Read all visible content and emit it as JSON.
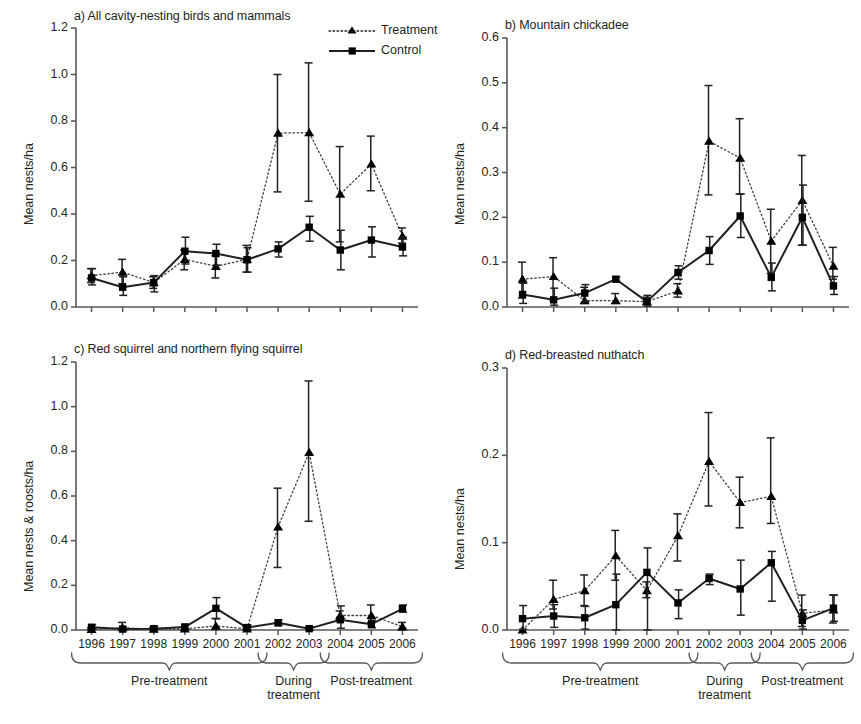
{
  "figure": {
    "legend": {
      "treatment_label": "Treatment",
      "control_label": "Control",
      "treatment_marker": "triangle-marker",
      "treatment_line": "dotted-line",
      "control_marker": "square-marker",
      "control_line": "solid-line"
    },
    "axis_groups": [
      {
        "label": "Pre-treatment",
        "years": [
          "1996",
          "1997",
          "1998",
          "1999",
          "2000",
          "2001"
        ]
      },
      {
        "label": "During\ntreatment",
        "label_line1": "During",
        "label_line2": "treatment",
        "years": [
          "2002",
          "2003"
        ]
      },
      {
        "label": "Post-treatment",
        "years": [
          "2004",
          "2005",
          "2006"
        ]
      }
    ],
    "years": [
      "1996",
      "1997",
      "1998",
      "1999",
      "2000",
      "2001",
      "2002",
      "2003",
      "2004",
      "2005",
      "2006"
    ],
    "colors": {
      "ink": "#231f20",
      "axis": "#58595b",
      "marker": "#000000"
    }
  },
  "chart_data": [
    {
      "panel": "a",
      "type": "line",
      "title": "a) All cavity-nesting birds and mammals",
      "xlabel": "",
      "ylabel": "Mean nests/ha",
      "ylim": [
        0.0,
        1.2
      ],
      "yticks": [
        0.0,
        0.2,
        0.4,
        0.6,
        0.8,
        1.0,
        1.2
      ],
      "ytick_labels": [
        "0.0",
        "0.2",
        "0.4",
        "0.6",
        "0.8",
        "1.0",
        "1.2"
      ],
      "grid": false,
      "legend_position": "top-right",
      "categories": [
        "1996",
        "1997",
        "1998",
        "1999",
        "2000",
        "2001",
        "2002",
        "2003",
        "2004",
        "2005",
        "2006"
      ],
      "series": [
        {
          "name": "Treatment",
          "values": [
            0.135,
            0.15,
            0.105,
            0.205,
            0.175,
            0.205,
            0.748,
            0.75,
            0.485,
            0.615,
            0.305
          ],
          "err_low": [
            0.105,
            0.1,
            0.08,
            0.16,
            0.125,
            0.15,
            0.495,
            0.455,
            0.28,
            0.5,
            0.275
          ],
          "err_high": [
            0.165,
            0.205,
            0.13,
            0.245,
            0.22,
            0.265,
            1.0,
            1.05,
            0.69,
            0.735,
            0.34
          ]
        },
        {
          "name": "Control",
          "values": [
            0.125,
            0.085,
            0.105,
            0.24,
            0.23,
            0.203,
            0.25,
            0.343,
            0.245,
            0.288,
            0.258
          ],
          "err_low": [
            0.095,
            0.05,
            0.065,
            0.185,
            0.18,
            0.15,
            0.215,
            0.283,
            0.16,
            0.215,
            0.22
          ],
          "err_high": [
            0.165,
            0.13,
            0.135,
            0.3,
            0.27,
            0.255,
            0.28,
            0.39,
            0.33,
            0.345,
            0.3
          ]
        }
      ]
    },
    {
      "panel": "b",
      "type": "line",
      "title": "b) Mountain chickadee",
      "xlabel": "",
      "ylabel": "Mean nests/ha",
      "ylim": [
        0.0,
        0.6
      ],
      "yticks": [
        0.0,
        0.1,
        0.2,
        0.3,
        0.4,
        0.5,
        0.6
      ],
      "ytick_labels": [
        "0.0",
        "0.1",
        "0.2",
        "0.3",
        "0.4",
        "0.5",
        "0.6"
      ],
      "grid": false,
      "legend_position": "none",
      "categories": [
        "1996",
        "1997",
        "1998",
        "1999",
        "2000",
        "2001",
        "2002",
        "2003",
        "2004",
        "2005",
        "2006"
      ],
      "series": [
        {
          "name": "Treatment",
          "values": [
            0.062,
            0.068,
            0.014,
            0.014,
            0.012,
            0.036,
            0.37,
            0.332,
            0.147,
            0.238,
            0.091
          ],
          "err_low": [
            0.02,
            0.016,
            0.008,
            0.008,
            0.006,
            0.022,
            0.25,
            0.252,
            0.075,
            0.138,
            0.062
          ],
          "err_high": [
            0.1,
            0.11,
            0.044,
            0.03,
            0.022,
            0.052,
            0.494,
            0.42,
            0.218,
            0.338,
            0.133
          ]
        },
        {
          "name": "Control",
          "values": [
            0.028,
            0.016,
            0.031,
            0.062,
            0.012,
            0.077,
            0.126,
            0.203,
            0.066,
            0.2,
            0.047
          ],
          "err_low": [
            0.008,
            0.004,
            0.012,
            0.057,
            0.002,
            0.062,
            0.095,
            0.155,
            0.036,
            0.138,
            0.028
          ],
          "err_high": [
            0.053,
            0.042,
            0.05,
            0.067,
            0.026,
            0.092,
            0.157,
            0.252,
            0.098,
            0.272,
            0.068
          ]
        }
      ]
    },
    {
      "panel": "c",
      "type": "line",
      "title": "c) Red squirrel and northern flying squirrel",
      "xlabel": "",
      "ylabel": "Mean nests & roosts/ha",
      "ylim": [
        0.0,
        1.2
      ],
      "yticks": [
        0.0,
        0.2,
        0.4,
        0.6,
        0.8,
        1.0,
        1.2
      ],
      "ytick_labels": [
        "0.0",
        "0.2",
        "0.4",
        "0.6",
        "0.8",
        "1.0",
        "1.2"
      ],
      "grid": false,
      "legend_position": "none",
      "categories": [
        "1996",
        "1997",
        "1998",
        "1999",
        "2000",
        "2001",
        "2002",
        "2003",
        "2004",
        "2005",
        "2006"
      ],
      "series": [
        {
          "name": "Treatment",
          "values": [
            0.003,
            0.01,
            0.004,
            0.005,
            0.018,
            0.005,
            0.462,
            0.795,
            0.065,
            0.065,
            0.015
          ],
          "err_low": [
            0.0,
            0.0,
            0.0,
            0.0,
            0.002,
            0.0,
            0.28,
            0.487,
            0.048,
            0.03,
            0.0
          ],
          "err_high": [
            0.01,
            0.034,
            0.012,
            0.014,
            0.052,
            0.014,
            0.635,
            1.115,
            0.085,
            0.112,
            0.034
          ]
        },
        {
          "name": "Control",
          "values": [
            0.012,
            0.004,
            0.006,
            0.013,
            0.097,
            0.011,
            0.032,
            0.006,
            0.046,
            0.026,
            0.095
          ],
          "err_low": [
            0.004,
            0.0,
            0.0,
            0.004,
            0.05,
            0.002,
            0.02,
            0.0,
            0.008,
            0.01,
            0.08
          ],
          "err_high": [
            0.024,
            0.012,
            0.016,
            0.026,
            0.145,
            0.022,
            0.046,
            0.014,
            0.108,
            0.044,
            0.112
          ]
        }
      ]
    },
    {
      "panel": "d",
      "type": "line",
      "title": "d) Red-breasted nuthatch",
      "xlabel": "",
      "ylabel": "Mean nests/ha",
      "ylim": [
        0.0,
        0.3
      ],
      "yticks": [
        0.0,
        0.1,
        0.2,
        0.3
      ],
      "ytick_labels": [
        "0.0",
        "0.1",
        "0.2",
        "0.3"
      ],
      "grid": false,
      "legend_position": "none",
      "categories": [
        "1996",
        "1997",
        "1998",
        "1999",
        "2000",
        "2001",
        "2002",
        "2003",
        "2004",
        "2005",
        "2006"
      ],
      "series": [
        {
          "name": "Treatment",
          "values": [
            0.0,
            0.035,
            0.045,
            0.085,
            0.045,
            0.108,
            0.193,
            0.146,
            0.153,
            0.019,
            0.023
          ],
          "err_low": [
            0.0,
            0.024,
            0.028,
            0.057,
            0.037,
            0.079,
            0.142,
            0.117,
            0.122,
            0.004,
            0.008
          ],
          "err_high": [
            0.0,
            0.057,
            0.063,
            0.114,
            0.055,
            0.133,
            0.249,
            0.175,
            0.22,
            0.04,
            0.04
          ]
        },
        {
          "name": "Control",
          "values": [
            0.013,
            0.016,
            0.014,
            0.029,
            0.066,
            0.031,
            0.059,
            0.047,
            0.077,
            0.011,
            0.025
          ],
          "err_low": [
            0.001,
            0.003,
            0.001,
            0.0,
            0.0,
            0.013,
            0.052,
            0.017,
            0.033,
            0.001,
            0.01
          ],
          "err_high": [
            0.028,
            0.029,
            0.027,
            0.064,
            0.094,
            0.046,
            0.064,
            0.08,
            0.09,
            0.023,
            0.04
          ]
        }
      ]
    }
  ]
}
